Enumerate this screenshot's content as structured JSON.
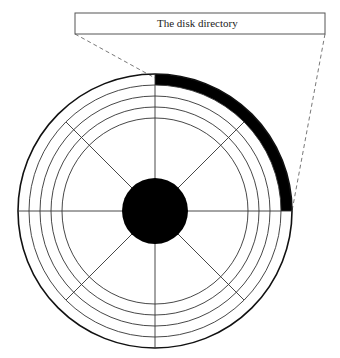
{
  "diagram": {
    "callout": {
      "label": "The disk directory",
      "box": {
        "x": 75,
        "y": 13,
        "width": 250,
        "height": 21
      },
      "leader_left": {
        "from": [
          75,
          34
        ],
        "to": [
          155,
          78
        ]
      },
      "leader_right": {
        "from": [
          325,
          34
        ],
        "to": [
          292,
          211
        ]
      }
    },
    "disk": {
      "center": [
        155,
        211
      ],
      "outer_radius": 137,
      "track_radii": [
        126,
        115,
        104,
        93
      ],
      "hub_radius": 33,
      "sector_count": 8,
      "highlighted_arc": {
        "start_deg": 0,
        "end_deg": 90,
        "inner_radius": 126,
        "outer_radius": 137,
        "description": "directory track region (first quadrant, outermost track)"
      }
    },
    "colors": {
      "ink": "#000000",
      "line": "#333333",
      "dash": "#555555",
      "background": "#ffffff"
    }
  }
}
